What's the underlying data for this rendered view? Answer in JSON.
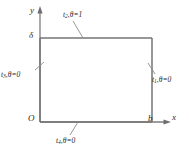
{
  "figure": {
    "type": "boundary-value-domain-diagram",
    "axes": {
      "x_label": "x",
      "y_label": "y",
      "origin_label": "O"
    },
    "ticks": {
      "y_tick_label": "δ",
      "x_tick_label": "b"
    },
    "domain": {
      "shape": "rectangle",
      "x_from": "0",
      "x_to": "b",
      "y_from": "0",
      "y_to": "δ"
    },
    "boundaries": [
      {
        "id": "t1",
        "name": "t",
        "subscript": "1",
        "condition": "θ=0",
        "text": "t₁,θ=0",
        "side": "right"
      },
      {
        "id": "t2",
        "name": "t",
        "subscript": "2",
        "condition": "θ=1",
        "text": "t₂,θ=1",
        "side": "top"
      },
      {
        "id": "t3",
        "name": "t",
        "subscript": "3",
        "condition": "θ=0",
        "text": "t₃,θ=0",
        "side": "left"
      },
      {
        "id": "t4",
        "name": "t",
        "subscript": "4",
        "condition": "θ=0",
        "text": "t₄,θ=0",
        "side": "bottom"
      }
    ],
    "colors": {
      "line": "#808080",
      "text": "#2b2b2b",
      "background": "#ffffff"
    }
  }
}
